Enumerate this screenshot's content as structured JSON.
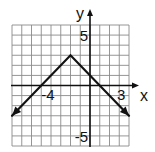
{
  "chart_data": {
    "type": "line",
    "title": "",
    "xlabel": "x",
    "ylabel": "y",
    "xlim": [
      -8,
      4
    ],
    "ylim": [
      -6,
      6
    ],
    "grid": true,
    "grid_step": 1,
    "tick_labels": [
      {
        "axis": "x",
        "value": -4,
        "text": "-4"
      },
      {
        "axis": "x",
        "value": 3,
        "text": "3"
      },
      {
        "axis": "y",
        "value": 5,
        "text": "5"
      },
      {
        "axis": "y",
        "value": -5,
        "text": "-5"
      }
    ],
    "series": [
      {
        "name": "y = -|x + 2| + 3",
        "points": [
          [
            -8,
            -3
          ],
          [
            -2,
            3
          ],
          [
            4,
            -3
          ]
        ],
        "arrows": "both-ends",
        "color": "#111111"
      }
    ]
  }
}
